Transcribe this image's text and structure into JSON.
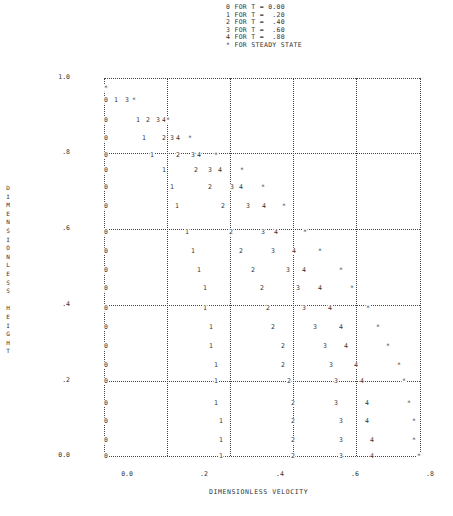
{
  "chart_data": {
    "type": "scatter",
    "title": "",
    "xlabel": "DIMENSIONLESS VELOCITY",
    "ylabel": "DIMENSIONLESS HEIGHT",
    "xlim": [
      0.0,
      0.84
    ],
    "ylim": [
      0.0,
      1.0
    ],
    "x_ticks": [
      "0.0",
      ".2",
      ".4",
      ".6",
      ".8"
    ],
    "y_ticks": [
      "1.0",
      ".8",
      ".6",
      ".4",
      ".2",
      "0.0"
    ],
    "grid": true,
    "legend": [
      {
        "symbol": "0",
        "label": "0 FOR T = 0.00"
      },
      {
        "symbol": "1",
        "label": "1 FOR T =  .20"
      },
      {
        "symbol": "2",
        "label": "2 FOR T =  .40"
      },
      {
        "symbol": "3",
        "label": "3 FOR T =  .60"
      },
      {
        "symbol": "4",
        "label": "4 FOR T =  .80"
      },
      {
        "symbol": "*",
        "label": "* FOR STEADY STATE"
      }
    ],
    "legend_position": "top",
    "series": [
      {
        "name": "T = 0.00",
        "symbol": "0",
        "points": [
          [
            0.0,
            1.0
          ],
          [
            0.0,
            0.95
          ],
          [
            0.0,
            0.9
          ],
          [
            0.0,
            0.85
          ],
          [
            0.0,
            0.8
          ],
          [
            0.0,
            0.75
          ],
          [
            0.0,
            0.7
          ],
          [
            0.0,
            0.65
          ],
          [
            0.0,
            0.6
          ],
          [
            0.0,
            0.55
          ],
          [
            0.0,
            0.5
          ],
          [
            0.0,
            0.45
          ],
          [
            0.0,
            0.4
          ],
          [
            0.0,
            0.35
          ],
          [
            0.0,
            0.3
          ],
          [
            0.0,
            0.25
          ],
          [
            0.0,
            0.2
          ],
          [
            0.0,
            0.15
          ],
          [
            0.0,
            0.1
          ],
          [
            0.0,
            0.05
          ],
          [
            0.0,
            0.0
          ]
        ]
      },
      {
        "name": "T = .20",
        "symbol": "1",
        "points": [
          [
            0.03,
            0.95
          ],
          [
            0.1,
            0.9
          ],
          [
            0.12,
            0.85
          ],
          [
            0.14,
            0.8
          ],
          [
            0.15,
            0.75
          ],
          [
            0.17,
            0.7
          ],
          [
            0.18,
            0.65
          ],
          [
            0.2,
            0.6
          ],
          [
            0.22,
            0.55
          ],
          [
            0.23,
            0.5
          ],
          [
            0.24,
            0.45
          ],
          [
            0.26,
            0.4
          ],
          [
            0.27,
            0.35
          ],
          [
            0.28,
            0.3
          ],
          [
            0.29,
            0.25
          ],
          [
            0.29,
            0.2
          ],
          [
            0.29,
            0.15
          ],
          [
            0.3,
            0.1
          ],
          [
            0.3,
            0.05
          ],
          [
            0.3,
            0.0
          ]
        ]
      },
      {
        "name": "T = .40",
        "symbol": "2",
        "points": [
          [
            0.13,
            0.9
          ],
          [
            0.17,
            0.85
          ],
          [
            0.19,
            0.8
          ],
          [
            0.27,
            0.75
          ],
          [
            0.3,
            0.7
          ],
          [
            0.36,
            0.65
          ],
          [
            0.4,
            0.6
          ],
          [
            0.37,
            0.55
          ],
          [
            0.41,
            0.5
          ],
          [
            0.45,
            0.45
          ],
          [
            0.46,
            0.4
          ],
          [
            0.47,
            0.35
          ],
          [
            0.49,
            0.3
          ],
          [
            0.5,
            0.25
          ],
          [
            0.5,
            0.2
          ],
          [
            0.5,
            0.15
          ],
          [
            0.5,
            0.1
          ],
          [
            0.5,
            0.05
          ],
          [
            0.5,
            0.0
          ]
        ]
      },
      {
        "name": "T = .60",
        "symbol": "3",
        "points": [
          [
            0.07,
            0.95
          ],
          [
            0.18,
            0.9
          ],
          [
            0.21,
            0.85
          ],
          [
            0.25,
            0.8
          ],
          [
            0.32,
            0.75
          ],
          [
            0.42,
            0.7
          ],
          [
            0.51,
            0.65
          ],
          [
            0.57,
            0.6
          ],
          [
            0.55,
            0.55
          ],
          [
            0.6,
            0.5
          ],
          [
            0.62,
            0.45
          ],
          [
            0.56,
            0.4
          ],
          [
            0.59,
            0.35
          ],
          [
            0.61,
            0.3
          ],
          [
            0.62,
            0.25
          ],
          [
            0.63,
            0.2
          ],
          [
            0.64,
            0.15
          ],
          [
            0.65,
            0.1
          ],
          [
            0.65,
            0.05
          ],
          [
            0.65,
            0.0
          ]
        ]
      },
      {
        "name": "T = .80",
        "symbol": "4",
        "points": [
          [
            0.2,
            0.9
          ],
          [
            0.22,
            0.85
          ],
          [
            0.26,
            0.8
          ],
          [
            0.35,
            0.75
          ],
          [
            0.45,
            0.7
          ],
          [
            0.56,
            0.65
          ],
          [
            0.6,
            0.6
          ],
          [
            0.63,
            0.55
          ],
          [
            0.68,
            0.5
          ],
          [
            0.7,
            0.45
          ],
          [
            0.7,
            0.4
          ],
          [
            0.69,
            0.35
          ],
          [
            0.71,
            0.3
          ],
          [
            0.72,
            0.25
          ],
          [
            0.71,
            0.2
          ],
          [
            0.73,
            0.15
          ],
          [
            0.73,
            0.1
          ],
          [
            0.74,
            0.05
          ],
          [
            0.74,
            0.0
          ]
        ]
      },
      {
        "name": "Steady state",
        "symbol": "*",
        "points": [
          [
            0.0,
            0.97
          ],
          [
            0.09,
            0.95
          ],
          [
            0.22,
            0.9
          ],
          [
            0.29,
            0.85
          ],
          [
            0.33,
            0.8
          ],
          [
            0.43,
            0.75
          ],
          [
            0.5,
            0.7
          ],
          [
            0.58,
            0.65
          ],
          [
            0.68,
            0.6
          ],
          [
            0.72,
            0.55
          ],
          [
            0.74,
            0.5
          ],
          [
            0.77,
            0.45
          ],
          [
            0.8,
            0.4
          ],
          [
            0.82,
            0.35
          ],
          [
            0.84,
            0.3
          ],
          [
            0.85,
            0.25
          ],
          [
            0.86,
            0.2
          ],
          [
            0.87,
            0.15
          ],
          [
            0.88,
            0.1
          ],
          [
            0.89,
            0.05
          ],
          [
            0.89,
            0.0
          ]
        ]
      }
    ]
  },
  "legend_text": "0 FOR T = 0.00\n1 FOR T =  .20\n2 FOR T =  .40\n3 FOR T =  .60\n4 FOR T =  .80\n* FOR STEADY STATE",
  "y_axis_label_vertical": "D\nI\nM\nE\nN\nS\nI\nO\nN\nL\nE\nS\nS\n \nH\nE\nI\nG\nH\nT",
  "x_axis_label": "DIMENSIONLESS VELOCITY",
  "layout": {
    "hgrid_y": [
      78,
      153,
      229,
      305,
      381,
      456
    ],
    "vgrid_x": [
      104,
      167,
      230,
      293,
      356,
      420
    ],
    "plot_left": 104,
    "plot_right": 420,
    "ytick_labels": [
      {
        "text": "1.0",
        "y": 78
      },
      {
        "text": ".8",
        "y": 153
      },
      {
        "text": ".6",
        "y": 229
      },
      {
        "text": ".4",
        "y": 305
      },
      {
        "text": ".2",
        "y": 381
      },
      {
        "text": "0.0",
        "y": 456
      }
    ],
    "xtick_labels": [
      {
        "text": "0.0",
        "x": 127
      },
      {
        "text": ".2",
        "x": 204
      },
      {
        "text": ".4",
        "x": 280
      },
      {
        "text": ".6",
        "x": 355
      },
      {
        "text": ".8",
        "x": 430
      }
    ],
    "markers": [
      [
        "*",
        106,
        88
      ],
      [
        "0",
        106,
        100
      ],
      [
        "1",
        116,
        100
      ],
      [
        "3",
        127,
        100
      ],
      [
        "*",
        134,
        100
      ],
      [
        "0",
        106,
        120
      ],
      [
        "1",
        138,
        120
      ],
      [
        "2",
        148,
        120
      ],
      [
        "3",
        158,
        120
      ],
      [
        "4",
        164,
        120
      ],
      [
        "*",
        168,
        120
      ],
      [
        "0",
        106,
        138
      ],
      [
        "1",
        144,
        138
      ],
      [
        "2",
        164,
        138
      ],
      [
        "3",
        172,
        138
      ],
      [
        "4",
        178,
        138
      ],
      [
        "*",
        190,
        138
      ],
      [
        "0",
        106,
        155
      ],
      [
        "1",
        152,
        155
      ],
      [
        "2",
        178,
        155
      ],
      [
        "3",
        193,
        155
      ],
      [
        "4",
        199,
        155
      ],
      [
        "*",
        216,
        155
      ],
      [
        "0",
        106,
        170
      ],
      [
        "1",
        164,
        170
      ],
      [
        "2",
        196,
        170
      ],
      [
        "3",
        210,
        170
      ],
      [
        "4",
        220,
        170
      ],
      [
        "*",
        242,
        170
      ],
      [
        "0",
        106,
        187
      ],
      [
        "1",
        172,
        187
      ],
      [
        "2",
        210,
        187
      ],
      [
        "3",
        232,
        187
      ],
      [
        "4",
        241,
        187
      ],
      [
        "*",
        263,
        187
      ],
      [
        "0",
        106,
        206
      ],
      [
        "1",
        177,
        206
      ],
      [
        "2",
        223,
        206
      ],
      [
        "3",
        248,
        206
      ],
      [
        "4",
        264,
        206
      ],
      [
        "*",
        284,
        206
      ],
      [
        "0",
        106,
        232
      ],
      [
        "1",
        187,
        232
      ],
      [
        "2",
        231,
        232
      ],
      [
        "3",
        263,
        232
      ],
      [
        "4",
        276,
        232
      ],
      [
        "*",
        305,
        232
      ],
      [
        "0",
        106,
        251
      ],
      [
        "1",
        193,
        251
      ],
      [
        "2",
        241,
        251
      ],
      [
        "3",
        273,
        251
      ],
      [
        "4",
        294,
        251
      ],
      [
        "*",
        320,
        251
      ],
      [
        "0",
        106,
        270
      ],
      [
        "1",
        199,
        270
      ],
      [
        "2",
        253,
        270
      ],
      [
        "3",
        288,
        270
      ],
      [
        "4",
        304,
        270
      ],
      [
        "*",
        341,
        270
      ],
      [
        "0",
        106,
        288
      ],
      [
        "1",
        205,
        288
      ],
      [
        "2",
        262,
        288
      ],
      [
        "3",
        298,
        288
      ],
      [
        "4",
        320,
        288
      ],
      [
        "*",
        352,
        288
      ],
      [
        "0",
        106,
        308
      ],
      [
        "1",
        205,
        308
      ],
      [
        "2",
        268,
        308
      ],
      [
        "3",
        304,
        308
      ],
      [
        "4",
        330,
        308
      ],
      [
        "*",
        368,
        308
      ],
      [
        "0",
        106,
        327
      ],
      [
        "1",
        211,
        327
      ],
      [
        "2",
        273,
        327
      ],
      [
        "3",
        315,
        327
      ],
      [
        "4",
        341,
        327
      ],
      [
        "*",
        378,
        327
      ],
      [
        "0",
        106,
        346
      ],
      [
        "1",
        211,
        346
      ],
      [
        "2",
        283,
        346
      ],
      [
        "3",
        325,
        346
      ],
      [
        "4",
        346,
        346
      ],
      [
        "*",
        388,
        346
      ],
      [
        "0",
        106,
        365
      ],
      [
        "1",
        216,
        365
      ],
      [
        "2",
        283,
        365
      ],
      [
        "3",
        331,
        365
      ],
      [
        "4",
        356,
        365
      ],
      [
        "*",
        399,
        365
      ],
      [
        "0",
        106,
        381
      ],
      [
        "1",
        216,
        381
      ],
      [
        "2",
        289,
        381
      ],
      [
        "3",
        336,
        381
      ],
      [
        "4",
        362,
        381
      ],
      [
        "*",
        404,
        381
      ],
      [
        "0",
        106,
        403
      ],
      [
        "1",
        216,
        403
      ],
      [
        "2",
        293,
        403
      ],
      [
        "3",
        336,
        403
      ],
      [
        "4",
        367,
        403
      ],
      [
        "*",
        409,
        403
      ],
      [
        "0",
        106,
        421
      ],
      [
        "1",
        221,
        421
      ],
      [
        "2",
        293,
        421
      ],
      [
        "3",
        341,
        421
      ],
      [
        "4",
        367,
        421
      ],
      [
        "*",
        414,
        421
      ],
      [
        "0",
        106,
        440
      ],
      [
        "1",
        221,
        440
      ],
      [
        "2",
        293,
        440
      ],
      [
        "3",
        341,
        440
      ],
      [
        "4",
        372,
        440
      ],
      [
        "*",
        414,
        440
      ],
      [
        "0",
        106,
        456
      ],
      [
        "1",
        221,
        456
      ],
      [
        "2",
        293,
        456
      ],
      [
        "3",
        341,
        456
      ],
      [
        "4",
        372,
        456
      ],
      [
        "*",
        419,
        456
      ]
    ]
  }
}
